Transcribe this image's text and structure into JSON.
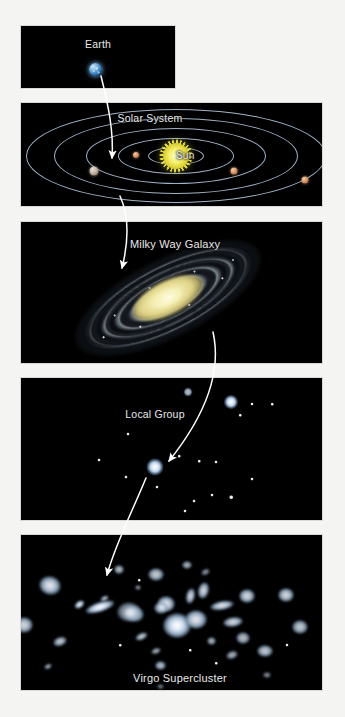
{
  "figure": {
    "background_color": "#f4f4f2",
    "panel_background": "#000000",
    "label_color": "#e9e9e9"
  },
  "panels": [
    {
      "id": "earth",
      "label": "Earth",
      "label_x": 98,
      "label_y": 38,
      "x": 21,
      "y": 26,
      "w": 154,
      "h": 62,
      "objects": [
        {
          "name": "earth-globe",
          "x": 95,
          "y": 69,
          "size": 13,
          "color": "#4f93cf"
        }
      ]
    },
    {
      "id": "solar-system",
      "label": "Solar System",
      "label_x": 150,
      "label_y": 112,
      "x": 21,
      "y": 103,
      "w": 301,
      "h": 103,
      "sun": {
        "label": "Sun",
        "x": 176,
        "y": 156,
        "color": "#f5f06a"
      },
      "orbits": [
        {
          "rx": 28,
          "ry": 9
        },
        {
          "rx": 58,
          "ry": 18
        },
        {
          "rx": 90,
          "ry": 28
        },
        {
          "rx": 122,
          "ry": 38
        },
        {
          "rx": 150,
          "ry": 47
        }
      ],
      "planets": [
        {
          "name": "planet-inner-left",
          "x": 136,
          "y": 155,
          "size": 6,
          "kind": "rock"
        },
        {
          "name": "planet-earth-marker",
          "x": 94,
          "y": 171,
          "size": 9,
          "kind": "grey"
        },
        {
          "name": "planet-right",
          "x": 234,
          "y": 171,
          "size": 7,
          "kind": "rock"
        },
        {
          "name": "planet-far-right",
          "x": 305,
          "y": 180,
          "size": 7,
          "kind": "rock"
        }
      ]
    },
    {
      "id": "milky-way",
      "label": "Milky Way Galaxy",
      "label_x": 175,
      "label_y": 238,
      "x": 21,
      "y": 222,
      "w": 301,
      "h": 141,
      "galaxy": {
        "name": "milky-way-galaxy",
        "x": 168,
        "y": 298,
        "tilt_deg": -27,
        "core_color": "#f2eba e"
      }
    },
    {
      "id": "local-group",
      "label": "Local Group",
      "label_x": 155,
      "label_y": 408,
      "x": 21,
      "y": 378,
      "w": 301,
      "h": 142,
      "galaxies": [
        {
          "x": 188,
          "y": 392,
          "size": 9,
          "bright": 0.75
        },
        {
          "x": 231,
          "y": 402,
          "size": 14,
          "bright": 1.0
        },
        {
          "x": 155,
          "y": 467,
          "size": 17,
          "bright": 1.0
        }
      ],
      "stars": [
        {
          "x": 252,
          "y": 404,
          "size": 3
        },
        {
          "x": 272,
          "y": 404,
          "size": 2.5
        },
        {
          "x": 240,
          "y": 415,
          "size": 2.5
        },
        {
          "x": 128,
          "y": 434,
          "size": 3
        },
        {
          "x": 99,
          "y": 460,
          "size": 3
        },
        {
          "x": 126,
          "y": 477,
          "size": 3
        },
        {
          "x": 179,
          "y": 456,
          "size": 2.5
        },
        {
          "x": 199,
          "y": 461,
          "size": 2.5
        },
        {
          "x": 216,
          "y": 462,
          "size": 3
        },
        {
          "x": 157,
          "y": 487,
          "size": 3
        },
        {
          "x": 194,
          "y": 501,
          "size": 3
        },
        {
          "x": 212,
          "y": 495,
          "size": 3
        },
        {
          "x": 231,
          "y": 497,
          "size": 3.5
        },
        {
          "x": 252,
          "y": 479,
          "size": 3
        },
        {
          "x": 185,
          "y": 511,
          "size": 3
        }
      ]
    },
    {
      "id": "virgo-supercluster",
      "label": "Virgo Supercluster",
      "label_x": 180,
      "label_y": 672,
      "x": 21,
      "y": 535,
      "w": 301,
      "h": 155,
      "galaxies": [
        {
          "x": 50,
          "y": 585,
          "w": 22,
          "h": 19,
          "rot": 15,
          "bright": 0.9
        },
        {
          "x": 24,
          "y": 625,
          "w": 18,
          "h": 16,
          "rot": 0,
          "bright": 0.85
        },
        {
          "x": 79,
          "y": 604,
          "w": 11,
          "h": 7,
          "rot": -35,
          "bright": 0.95
        },
        {
          "x": 104,
          "y": 598,
          "w": 9,
          "h": 5,
          "rot": -25,
          "bright": 0.8
        },
        {
          "x": 100,
          "y": 607,
          "w": 30,
          "h": 10,
          "rot": -18,
          "bright": 1.0
        },
        {
          "x": 60,
          "y": 641,
          "w": 14,
          "h": 9,
          "rot": -20,
          "bright": 0.8
        },
        {
          "x": 48,
          "y": 666,
          "w": 8,
          "h": 5,
          "rot": -25,
          "bright": 0.7
        },
        {
          "x": 119,
          "y": 569,
          "w": 10,
          "h": 9,
          "rot": 0,
          "bright": 0.75
        },
        {
          "x": 138,
          "y": 587,
          "w": 6,
          "h": 5,
          "rot": 0,
          "bright": 0.6
        },
        {
          "x": 134,
          "y": 614,
          "w": 20,
          "h": 16,
          "rot": 10,
          "bright": 0.85
        },
        {
          "x": 129,
          "y": 612,
          "w": 24,
          "h": 20,
          "rot": 0,
          "bright": 0.7
        },
        {
          "x": 141,
          "y": 636,
          "w": 13,
          "h": 7,
          "rot": -25,
          "bright": 0.8
        },
        {
          "x": 156,
          "y": 651,
          "w": 10,
          "h": 6,
          "rot": -20,
          "bright": 0.7
        },
        {
          "x": 166,
          "y": 604,
          "w": 18,
          "h": 16,
          "rot": 0,
          "bright": 0.9
        },
        {
          "x": 161,
          "y": 608,
          "w": 14,
          "h": 12,
          "rot": 0,
          "bright": 0.8
        },
        {
          "x": 177,
          "y": 625,
          "w": 28,
          "h": 25,
          "rot": 0,
          "bright": 1.0
        },
        {
          "x": 160,
          "y": 665,
          "w": 11,
          "h": 9,
          "rot": 0,
          "bright": 0.75
        },
        {
          "x": 190,
          "y": 596,
          "w": 9,
          "h": 16,
          "rot": 12,
          "bright": 0.85
        },
        {
          "x": 203,
          "y": 590,
          "w": 11,
          "h": 17,
          "rot": 14,
          "bright": 0.85
        },
        {
          "x": 196,
          "y": 619,
          "w": 22,
          "h": 19,
          "rot": 0,
          "bright": 0.9
        },
        {
          "x": 211,
          "y": 641,
          "w": 9,
          "h": 8,
          "rot": 0,
          "bright": 0.7
        },
        {
          "x": 222,
          "y": 605,
          "w": 24,
          "h": 9,
          "rot": -10,
          "bright": 0.9
        },
        {
          "x": 233,
          "y": 622,
          "w": 20,
          "h": 10,
          "rot": -8,
          "bright": 0.85
        },
        {
          "x": 247,
          "y": 596,
          "w": 16,
          "h": 14,
          "rot": 0,
          "bright": 0.85
        },
        {
          "x": 243,
          "y": 638,
          "w": 14,
          "h": 12,
          "rot": 0,
          "bright": 0.75
        },
        {
          "x": 232,
          "y": 655,
          "w": 12,
          "h": 8,
          "rot": -20,
          "bright": 0.7
        },
        {
          "x": 265,
          "y": 651,
          "w": 16,
          "h": 12,
          "rot": 0,
          "bright": 0.8
        },
        {
          "x": 286,
          "y": 595,
          "w": 16,
          "h": 14,
          "rot": 0,
          "bright": 0.85
        },
        {
          "x": 300,
          "y": 627,
          "w": 16,
          "h": 14,
          "rot": 0,
          "bright": 0.8
        },
        {
          "x": 156,
          "y": 574,
          "w": 16,
          "h": 13,
          "rot": 0,
          "bright": 0.8
        },
        {
          "x": 187,
          "y": 565,
          "w": 10,
          "h": 8,
          "rot": 0,
          "bright": 0.7
        },
        {
          "x": 205,
          "y": 572,
          "w": 9,
          "h": 6,
          "rot": -25,
          "bright": 0.6
        },
        {
          "x": 267,
          "y": 675,
          "w": 8,
          "h": 6,
          "rot": 0,
          "bright": 0.55
        },
        {
          "x": 160,
          "y": 686,
          "w": 7,
          "h": 5,
          "rot": 0,
          "bright": 0.5
        }
      ],
      "stars": [
        {
          "x": 139,
          "y": 580,
          "size": 2.5
        },
        {
          "x": 216,
          "y": 663,
          "size": 2.5
        },
        {
          "x": 287,
          "y": 645,
          "size": 3
        },
        {
          "x": 120,
          "y": 645,
          "size": 2.5
        },
        {
          "x": 190,
          "y": 650,
          "size": 2.5
        }
      ]
    }
  ],
  "arrows": [
    {
      "name": "arrow-earth-to-solar-system",
      "from": "Earth",
      "to": "Solar System"
    },
    {
      "name": "arrow-solar-system-to-milky-way",
      "from": "Solar System",
      "to": "Milky Way Galaxy"
    },
    {
      "name": "arrow-milky-way-to-local-group",
      "from": "Milky Way Galaxy",
      "to": "Local Group"
    },
    {
      "name": "arrow-local-group-to-virgo",
      "from": "Local Group",
      "to": "Virgo Supercluster"
    }
  ]
}
